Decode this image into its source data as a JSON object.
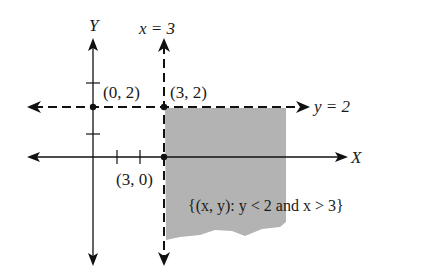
{
  "figure": {
    "type": "coordinate-plane-inequality-region",
    "axis_labels": {
      "y_axis": "Y",
      "x_axis": "X"
    },
    "boundary_lines": [
      {
        "equation": "x = 3",
        "style": "dashed",
        "orientation": "vertical"
      },
      {
        "equation": "y = 2",
        "style": "dashed",
        "orientation": "horizontal"
      }
    ],
    "points": [
      {
        "label": "(0, 2)",
        "x": 0,
        "y": 2
      },
      {
        "label": "(3, 2)",
        "x": 3,
        "y": 2
      },
      {
        "label": "(3, 0)",
        "x": 3,
        "y": 0
      }
    ],
    "region_label": "{(x, y): y < 2 and x > 3}",
    "region": {
      "condition": "y < 2 and x > 3",
      "shade_color": "#b3b3b3"
    },
    "colors": {
      "ink": "#111111",
      "shade": "#b3b3b3",
      "background": "#ffffff"
    }
  },
  "labels": {
    "y_axis": "Y",
    "x_axis": "X",
    "line_x3": "x = 3",
    "line_y2": "y = 2",
    "pt_0_2": "(0, 2)",
    "pt_3_2": "(3, 2)",
    "pt_3_0": "(3, 0)",
    "region": "{(x, y): y < 2 and x > 3}"
  }
}
